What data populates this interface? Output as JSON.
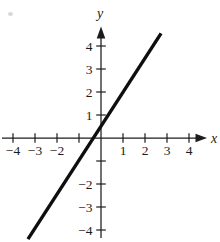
{
  "chart_data": {
    "type": "line",
    "title": "",
    "xlabel": "x",
    "ylabel": "y",
    "xlim": [
      -4.5,
      4.8
    ],
    "ylim": [
      -4.5,
      4.8
    ],
    "grid": false,
    "legend": false,
    "x_ticks": [
      -4,
      -3,
      -2,
      -1,
      1,
      2,
      3,
      4
    ],
    "x_tick_labels": [
      "−4",
      "−3",
      "−2",
      "",
      "1",
      "2",
      "3",
      "4"
    ],
    "y_ticks": [
      -4,
      -3,
      -2,
      -1,
      1,
      2,
      3,
      4
    ],
    "y_tick_labels": [
      "−4",
      "−3",
      "−2",
      "",
      "1",
      "2",
      "3",
      "4"
    ],
    "series": [
      {
        "name": "line-segment",
        "x": [
          -3.32,
          2.73
        ],
        "y": [
          -4.4,
          4.55
        ]
      }
    ],
    "line_equation": {
      "slope": 1.5,
      "intercept": 0.5
    },
    "colors": {
      "axis": "#1c1c1c",
      "line": "#0e0e0e",
      "text": "#1c1c1c",
      "background": "#ffffff"
    }
  }
}
